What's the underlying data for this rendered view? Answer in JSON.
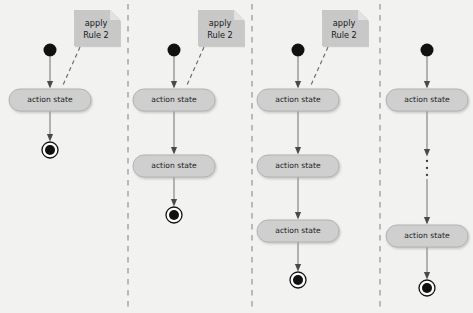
{
  "canvas": {
    "width": 473,
    "height": 313,
    "background": "#f2f2f0"
  },
  "palette": {
    "state_fill": "#cfcfcf",
    "state_stroke": "#b4b4b4",
    "state_shadow": "#d8d8d6",
    "note_fill": "#c8c8c8",
    "note_fold": "#e2e2e2",
    "arrow_line": "#8a8a8a",
    "arrow_head": "#4a4a4a",
    "initial_fill": "#111111",
    "final_fill": "#111111",
    "final_ring": "#111111",
    "divider": "#9a9a9a",
    "text": "#1b1b1b"
  },
  "diagram": {
    "dividers": [
      128,
      252,
      380
    ],
    "panels": [
      {
        "id": "panel-1",
        "index": 1,
        "center_x": 50,
        "note": {
          "text_line1": "apply",
          "text_line2": "Rule 2",
          "x": 74,
          "y": 10,
          "width": 46,
          "height": 36
        },
        "initial_state": {
          "cx": 50,
          "cy": 50,
          "r": 6.5
        },
        "action_states": [
          {
            "label": "action state",
            "cx": 50,
            "cy": 100,
            "width": 82,
            "height": 22
          }
        ],
        "ellipsis": null,
        "final_state": {
          "cx": 50,
          "cy": 150,
          "r_outer": 8,
          "r_inner": 5
        }
      },
      {
        "id": "panel-2",
        "index": 2,
        "center_x": 174,
        "note": {
          "text_line1": "apply",
          "text_line2": "Rule 2",
          "x": 198,
          "y": 10,
          "width": 46,
          "height": 36
        },
        "initial_state": {
          "cx": 174,
          "cy": 50,
          "r": 6.5
        },
        "action_states": [
          {
            "label": "action state",
            "cx": 174,
            "cy": 100,
            "width": 82,
            "height": 22
          },
          {
            "label": "action state",
            "cx": 174,
            "cy": 166,
            "width": 82,
            "height": 22
          }
        ],
        "ellipsis": null,
        "final_state": {
          "cx": 174,
          "cy": 215,
          "r_outer": 8,
          "r_inner": 5
        }
      },
      {
        "id": "panel-3",
        "index": 3,
        "center_x": 298,
        "note": {
          "text_line1": "apply",
          "text_line2": "Rule 2",
          "x": 322,
          "y": 10,
          "width": 46,
          "height": 36
        },
        "initial_state": {
          "cx": 298,
          "cy": 50,
          "r": 6.5
        },
        "action_states": [
          {
            "label": "action state",
            "cx": 298,
            "cy": 100,
            "width": 82,
            "height": 22
          },
          {
            "label": "action state",
            "cx": 298,
            "cy": 166,
            "width": 82,
            "height": 22
          },
          {
            "label": "action state",
            "cx": 298,
            "cy": 231,
            "width": 82,
            "height": 22
          }
        ],
        "ellipsis": null,
        "final_state": {
          "cx": 298,
          "cy": 280,
          "r_outer": 8,
          "r_inner": 5
        }
      },
      {
        "id": "panel-4",
        "index": 4,
        "center_x": 427,
        "note": null,
        "initial_state": {
          "cx": 427,
          "cy": 50,
          "r": 6.5
        },
        "action_states": [
          {
            "label": "action state",
            "cx": 427,
            "cy": 100,
            "width": 82,
            "height": 22
          },
          {
            "label": "action state",
            "cx": 427,
            "cy": 236,
            "width": 82,
            "height": 22
          }
        ],
        "ellipsis": {
          "cx": 427,
          "cy": 168,
          "dots": 3,
          "symbol": "vertical-ellipsis"
        },
        "final_state": {
          "cx": 427,
          "cy": 288,
          "r_outer": 8,
          "r_inner": 5
        }
      }
    ]
  }
}
